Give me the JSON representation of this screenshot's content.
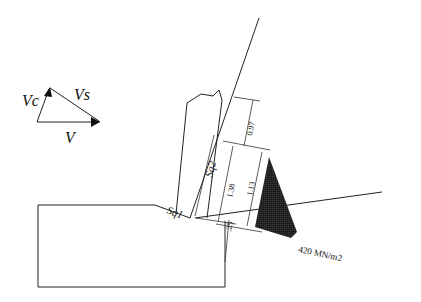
{
  "velocity_diagram": {
    "vc_label": "Vc",
    "vs_label": "Vs",
    "v_label": "V"
  },
  "surface_labels": {
    "sq1": "Sq1",
    "sq2": "Sq2"
  },
  "dimensions": {
    "d1": "0.97",
    "d2": "1.38",
    "d3": "1.13",
    "d4": ".25"
  },
  "stress": {
    "label": "420 MN/m2",
    "fill_color": "#1e1e1e"
  }
}
